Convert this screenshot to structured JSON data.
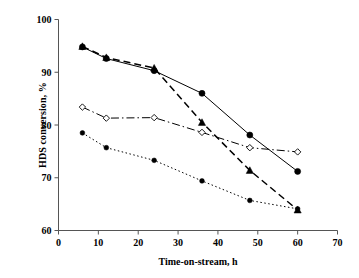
{
  "chart_data": {
    "type": "line",
    "title": "",
    "xlabel": "Time-on-stream, h",
    "ylabel": "HDS conversion, %",
    "xlim": [
      0,
      70
    ],
    "ylim": [
      60,
      100
    ],
    "xticks": [
      0,
      10,
      20,
      30,
      40,
      50,
      60,
      70
    ],
    "yticks": [
      60,
      70,
      80,
      90,
      100
    ],
    "grid": false,
    "legend": "none",
    "series": [
      {
        "name": "series-1",
        "marker": "filled-circle",
        "linestyle": "solid",
        "color": "#000000",
        "x": [
          6,
          12,
          24,
          36,
          48,
          60
        ],
        "values": [
          94.8,
          92.6,
          90.3,
          86.0,
          78.1,
          71.2
        ]
      },
      {
        "name": "series-2",
        "marker": "filled-triangle",
        "linestyle": "dashed",
        "color": "#000000",
        "x": [
          6,
          12,
          24,
          36,
          48,
          60
        ],
        "values": [
          94.9,
          92.8,
          90.8,
          80.5,
          71.4,
          63.9
        ]
      },
      {
        "name": "series-3",
        "marker": "open-diamond",
        "linestyle": "dash-dot",
        "color": "#000000",
        "x": [
          6,
          12,
          24,
          36,
          48,
          60
        ],
        "values": [
          83.4,
          81.3,
          81.4,
          78.6,
          75.7,
          74.9
        ]
      },
      {
        "name": "series-4",
        "marker": "small-filled-circle",
        "linestyle": "dotted",
        "color": "#000000",
        "x": [
          6,
          12,
          24,
          36,
          48,
          60
        ],
        "values": [
          78.5,
          75.7,
          73.3,
          69.4,
          65.7,
          64.1
        ]
      }
    ]
  },
  "axis": {
    "x_tick_labels": [
      "0",
      "10",
      "20",
      "30",
      "40",
      "50",
      "60",
      "70"
    ],
    "y_tick_labels": [
      "60",
      "70",
      "80",
      "90",
      "100"
    ],
    "x_title": "Time-on-stream, h",
    "y_title": "HDS conversion, %"
  }
}
